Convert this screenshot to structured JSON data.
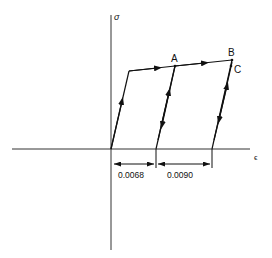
{
  "diagram": {
    "type": "stress-strain loading-unloading",
    "axes": {
      "y_label": "σ",
      "x_label": "ϵ"
    },
    "points": {
      "A": "A",
      "B": "B",
      "C": "C"
    },
    "dimensions": [
      {
        "label": "0.0068"
      },
      {
        "label": "0.0090"
      }
    ],
    "colors": {
      "line": "#111111",
      "background": "#ffffff"
    }
  }
}
